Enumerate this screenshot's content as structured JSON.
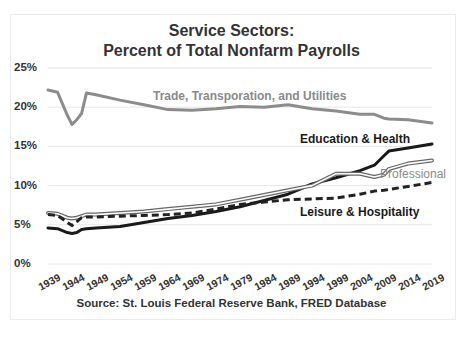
{
  "chart_data": {
    "type": "line",
    "title": "Service Sectors:",
    "subtitle": "Percent of Total Nonfarm Payrolls",
    "xlabel": "",
    "ylabel": "",
    "ylim": [
      0,
      25
    ],
    "y_ticks": [
      "0%",
      "5%",
      "10%",
      "15%",
      "20%",
      "25%"
    ],
    "x_ticks": [
      "1939",
      "1944",
      "1949",
      "1954",
      "1959",
      "1964",
      "1969",
      "1974",
      "1979",
      "1984",
      "1989",
      "1994",
      "1999",
      "2004",
      "2009",
      "2014",
      "2019"
    ],
    "grid": true,
    "legend": "inline labels",
    "source": "Source: St. Louis Federal Reserve Bank, FRED Database",
    "x": [
      1939,
      1941,
      1943,
      1944,
      1945,
      1946,
      1947,
      1949,
      1954,
      1959,
      1964,
      1969,
      1974,
      1979,
      1984,
      1989,
      1994,
      1999,
      2004,
      2007,
      2009,
      2010,
      2014,
      2019
    ],
    "series": [
      {
        "name": "Trade, Transporation, and Utilities",
        "style": "solid-gray-thick",
        "color": "#8c8c8c",
        "values": [
          22.2,
          21.9,
          19.0,
          17.8,
          18.4,
          19.2,
          21.8,
          21.6,
          20.9,
          20.3,
          19.7,
          19.6,
          19.8,
          20.1,
          20.0,
          20.3,
          19.8,
          19.5,
          19.1,
          19.1,
          18.6,
          18.5,
          18.4,
          18.0
        ]
      },
      {
        "name": "Education & Health",
        "style": "solid-black-thick",
        "color": "#1a1a1a",
        "values": [
          4.6,
          4.5,
          4.0,
          3.9,
          4.0,
          4.4,
          4.5,
          4.6,
          4.8,
          5.3,
          5.8,
          6.2,
          6.7,
          7.3,
          8.1,
          8.9,
          10.2,
          11.0,
          11.9,
          12.6,
          13.8,
          14.4,
          14.8,
          15.3
        ]
      },
      {
        "name": "Professional",
        "style": "double-line-gray",
        "color": "#666666",
        "values": [
          6.5,
          6.4,
          5.9,
          5.8,
          5.9,
          6.1,
          6.3,
          6.3,
          6.5,
          6.7,
          7.0,
          7.3,
          7.6,
          8.2,
          8.8,
          9.4,
          10.0,
          11.5,
          11.5,
          11.1,
          11.4,
          12.1,
          12.8,
          13.2
        ]
      },
      {
        "name": "Leisure & Hospitality",
        "style": "dashed-black",
        "color": "#222222",
        "values": [
          6.3,
          6.2,
          5.3,
          4.9,
          5.4,
          5.9,
          6.0,
          6.0,
          6.1,
          6.2,
          6.3,
          6.5,
          7.0,
          7.6,
          7.9,
          8.2,
          8.3,
          8.4,
          8.9,
          9.3,
          9.4,
          9.5,
          9.9,
          10.4
        ]
      }
    ]
  },
  "labels": {
    "title_line1": "Service Sectors:",
    "title_line2": "Percent of Total Nonfarm Payrolls",
    "trade": "Trade, Transporation, and Utilities",
    "education": "Education & Health",
    "professional": "Professional",
    "leisure": "Leisure & Hospitality",
    "source": "Source: St. Louis Federal Reserve Bank, FRED Database"
  }
}
